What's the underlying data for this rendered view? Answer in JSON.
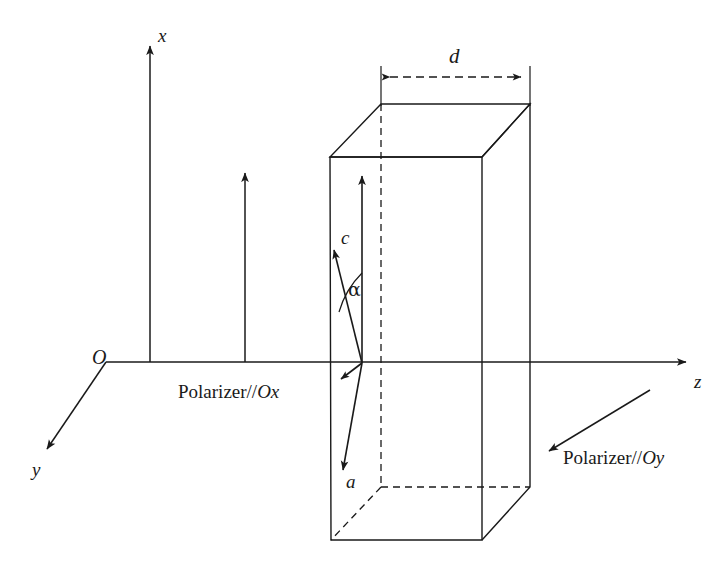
{
  "figure": {
    "type": "3d-optical-diagram",
    "background_color": "#ffffff",
    "stroke_color": "#1a1a1a"
  },
  "axes": {
    "origin_label": "O",
    "x_label": "x",
    "y_label": "y",
    "z_label": "z"
  },
  "vectors": {
    "c_label": "c",
    "a_label": "a",
    "angle_label": "α"
  },
  "dimensions": {
    "thickness_label": "d"
  },
  "annotations": {
    "polarizer_x": "Polarizer//",
    "polarizer_x_italic": "Ox",
    "polarizer_y": "Polarizer//",
    "polarizer_y_italic": "Oy"
  },
  "geometry": {
    "origin": [
      106,
      362
    ],
    "x_axis_tip": [
      150,
      40
    ],
    "z_axis_tip": [
      692,
      362
    ],
    "y_axis_tip": [
      42,
      455
    ],
    "box_top_back_left": [
      381,
      104
    ],
    "box_top_back_right": [
      530,
      104
    ],
    "box_top_front_right": [
      482,
      157
    ],
    "box_top_front_left": [
      330,
      157
    ],
    "box_bot_front_left": [
      331,
      540
    ],
    "box_bot_front_right": [
      482,
      540
    ],
    "box_bot_back_right": [
      530,
      487
    ],
    "box_bot_back_left": [
      381,
      487
    ],
    "vector_base": [
      362,
      363
    ],
    "c_tip": [
      332,
      243
    ],
    "a_tip": [
      342,
      477
    ],
    "normal_tip": [
      362,
      170
    ],
    "short_arrow_tip": [
      337,
      382
    ],
    "polarizer_arrow_tip": [
      245,
      167
    ],
    "polarizer_y_arrow_tail": [
      650,
      390
    ],
    "polarizer_y_arrow_tip": [
      543,
      455
    ],
    "dim_line_y": 77
  }
}
